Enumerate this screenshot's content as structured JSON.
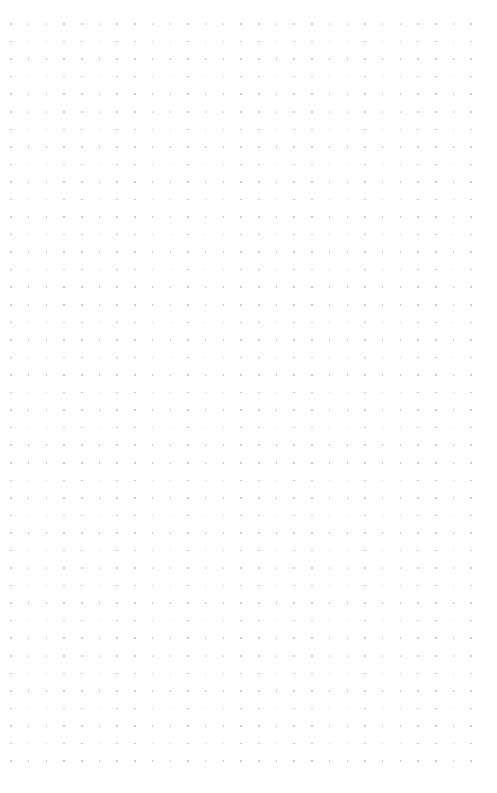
{
  "document": {
    "kind": "dot-grid-page",
    "title": "",
    "page_width": 497,
    "page_height": 793,
    "background_color": "#ffffff",
    "visible_text": [],
    "annotations": [],
    "content_blocks": []
  },
  "grid": {
    "name": "dot-grid",
    "dot_color": "#9a9aa6",
    "dot_opacity": 0.62,
    "dot_diameter_px": 1.6,
    "spacing_x_px": 17.7,
    "spacing_y_px": 17.55,
    "origin_x_px": 11,
    "origin_y_px": 24,
    "columns": 27,
    "rows": 43
  },
  "margins": {
    "top_px": 24,
    "left_px": 11,
    "right_px": 25,
    "bottom_px": 18
  }
}
